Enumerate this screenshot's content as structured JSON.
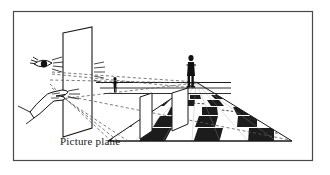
{
  "figure": {
    "domain": "diagram",
    "canvas": {
      "width": 330,
      "height": 175
    },
    "background_color": "#ffffff",
    "frame": {
      "name": "outer-frame",
      "x": 13,
      "y": 11,
      "width": 300,
      "height": 150,
      "stroke_color": "#4a4a4a",
      "stroke_width": 1.2,
      "fill": "#ffffff"
    },
    "caption": {
      "label": "Picture plane",
      "x": 60,
      "y": 145,
      "font_size": 11,
      "color": "#1a1a1a"
    },
    "picture_plane": {
      "name": "picture-plane-quad",
      "description": "transparent vertical plane drawn as a parallelogram in perspective",
      "points": "63,33 92,27 92,128 63,137",
      "stroke_color": "#1a1a1a",
      "stroke_width": 1.1,
      "fill": "none"
    },
    "eye": {
      "name": "observer-eye",
      "label": "eye",
      "cx": 37,
      "cy": 64,
      "color": "#111111"
    },
    "hand": {
      "name": "observer-hand",
      "label": "hand",
      "cx": 47,
      "cy": 95,
      "color": "#111111"
    },
    "sight_lines": {
      "name": "sight-lines",
      "label": "dashed lines of sight",
      "dash_pattern": "3,2.4",
      "stroke_color": "#5a5a5a",
      "stroke_width": 0.8,
      "origin": {
        "x": 50,
        "y": 80
      },
      "vanishing_point": {
        "x": 196,
        "y": 82
      }
    },
    "ground_plane": {
      "name": "checkerboard-floor",
      "label": "checkerboard ground plane",
      "dark_color": "#1d1d1d",
      "light_color": "#ffffff",
      "outline_color": "#1a1a1a",
      "columns": 8,
      "rows": 5
    },
    "horizon": {
      "name": "horizon-line",
      "label": "horizon",
      "y": 82,
      "x1": 96,
      "x2": 231,
      "stroke_color": "#1a1a1a"
    },
    "panels": [
      {
        "name": "standing-panel-near",
        "label": "near upright panel",
        "points": "140,97 152,93 152,131 140,139",
        "fill": "#ffffff",
        "stroke_color": "#1a1a1a"
      },
      {
        "name": "standing-panel-far",
        "label": "far upright panel",
        "points": "172,93 188,88 188,124 172,131",
        "fill": "#ffffff",
        "stroke_color": "#1a1a1a"
      }
    ],
    "figures": [
      {
        "name": "distant-figure-small",
        "label": "small distant figure",
        "x": 115,
        "y": 88,
        "height": 13,
        "color": "#111111"
      },
      {
        "name": "distant-figure-large",
        "label": "large standing figure",
        "x": 190,
        "y": 62,
        "height": 25,
        "color": "#111111"
      }
    ],
    "icon_names": [
      "eye-icon",
      "pointing-hand-icon",
      "human-figure-icon",
      "checkerboard-icon",
      "picture-plane-icon"
    ]
  }
}
